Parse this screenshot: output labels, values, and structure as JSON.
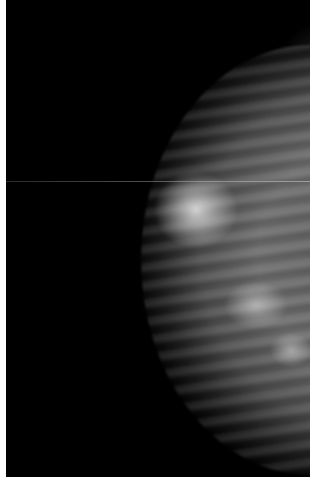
{
  "image": {
    "type": "mammogram",
    "description": "Grayscale X-ray mammogram showing breast tissue on the right side against a black background, with thin white borders on left, right and bottom edges and a faint horizontal scan line.",
    "colors": {
      "background": "#000000",
      "border": "#ffffff",
      "tissue_mid": "#6a6a6a",
      "tissue_bright": "#ebebeb"
    }
  }
}
